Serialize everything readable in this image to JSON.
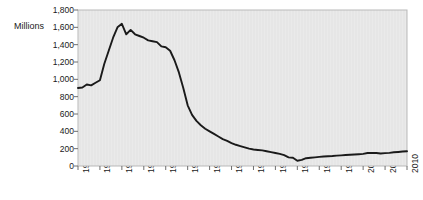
{
  "chart_data": {
    "type": "line",
    "title": "",
    "subtitle": "",
    "xlabel": "",
    "ylabel": "Millions",
    "ylim": [
      0,
      1800
    ],
    "xlim": [
      1935,
      2010
    ],
    "grid": false,
    "legend": "none",
    "y_ticks": [
      1800,
      1600,
      1400,
      1200,
      1000,
      800,
      600,
      400,
      200,
      0
    ],
    "y_tick_labels": [
      "1,800",
      "1,600",
      "1,400",
      "1,200",
      "1,000",
      "800",
      "600",
      "400",
      "200",
      "0"
    ],
    "x_ticks": [
      1935,
      1940,
      1945,
      1950,
      1955,
      1960,
      1965,
      1970,
      1975,
      1980,
      1985,
      1990,
      1995,
      2000,
      2005,
      2010
    ],
    "x_tick_labels": [
      "1935",
      "1940",
      "1945",
      "1950",
      "1955",
      "1960",
      "1965",
      "1970",
      "1975",
      "1980",
      "1985",
      "1990",
      "1995",
      "2000",
      "2005",
      "2010"
    ],
    "series": [
      {
        "name": "Millions",
        "color": "#1a1a1a",
        "x": [
          1935,
          1936,
          1937,
          1938,
          1939,
          1940,
          1941,
          1942,
          1943,
          1944,
          1945,
          1946,
          1947,
          1948,
          1949,
          1950,
          1951,
          1952,
          1953,
          1954,
          1955,
          1956,
          1957,
          1958,
          1959,
          1960,
          1961,
          1962,
          1963,
          1964,
          1965,
          1966,
          1967,
          1968,
          1969,
          1970,
          1971,
          1972,
          1973,
          1974,
          1975,
          1976,
          1977,
          1978,
          1979,
          1980,
          1981,
          1982,
          1983,
          1984,
          1985,
          1986,
          1987,
          1988,
          1989,
          1990,
          1991,
          1992,
          1993,
          1994,
          1995,
          1996,
          1997,
          1998,
          1999,
          2000,
          2001,
          2002,
          2003,
          2004,
          2005,
          2006,
          2007,
          2008,
          2009,
          2010
        ],
        "values": [
          900,
          905,
          940,
          930,
          960,
          990,
          1180,
          1330,
          1480,
          1600,
          1640,
          1520,
          1570,
          1520,
          1500,
          1480,
          1450,
          1440,
          1430,
          1380,
          1370,
          1330,
          1220,
          1080,
          900,
          700,
          590,
          520,
          470,
          430,
          400,
          370,
          340,
          310,
          290,
          265,
          245,
          230,
          215,
          200,
          190,
          185,
          180,
          170,
          160,
          150,
          140,
          125,
          100,
          95,
          60,
          70,
          90,
          95,
          100,
          105,
          110,
          112,
          115,
          120,
          123,
          127,
          130,
          133,
          136,
          140,
          150,
          152,
          150,
          145,
          148,
          152,
          158,
          162,
          167,
          170
        ]
      }
    ]
  },
  "plot_area": {
    "background_color": "#e6e6e6",
    "border_color": "#b4b4b4"
  }
}
